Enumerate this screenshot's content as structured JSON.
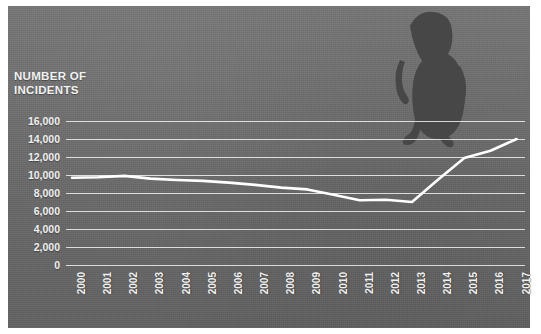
{
  "figure": {
    "axis_title_line1": "NUMBER OF",
    "axis_title_line2": "INCIDENTS",
    "panel_color": "#6e6e6e",
    "line_color": "#ffffff",
    "gridline_color": "#ffffff",
    "label_color": "#f0f0f0",
    "silhouette_color": "#4a4a4a",
    "silhouette_label": "person-silhouette"
  },
  "chart_data": {
    "type": "line",
    "title": "NUMBER OF INCIDENTS",
    "xlabel": "",
    "ylabel": "NUMBER OF INCIDENTS",
    "ylim": [
      0,
      16000
    ],
    "ytick_labels": [
      "16,000",
      "14,000",
      "12,000",
      "10,000",
      "8,000",
      "6,000",
      "4,000",
      "2,000",
      "0"
    ],
    "yticks": [
      16000,
      14000,
      12000,
      10000,
      8000,
      6000,
      4000,
      2000,
      0
    ],
    "grid": true,
    "legend": "none",
    "categories": [
      "2000",
      "2001",
      "2002",
      "2003",
      "2004",
      "2005",
      "2006",
      "2007",
      "2008",
      "2009",
      "2010",
      "2011",
      "2012",
      "2013",
      "2014",
      "2015",
      "2016",
      "2017"
    ],
    "series": [
      {
        "name": "Incidents",
        "values": [
          9700,
          9750,
          9900,
          9600,
          9450,
          9350,
          9150,
          8900,
          8600,
          8400,
          7800,
          7200,
          7250,
          7000,
          9500,
          11900,
          12700,
          14000
        ]
      }
    ]
  }
}
